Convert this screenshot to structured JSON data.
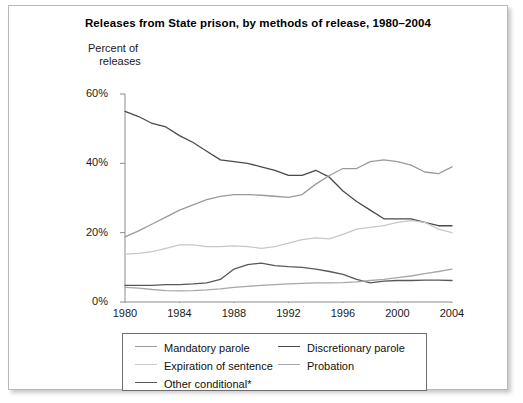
{
  "chart_data": {
    "type": "line",
    "title": "Releases from State prison, by methods of release, 1980–2004",
    "ylabel_line1": "Percent of",
    "ylabel_line2": "releases",
    "xlabel": "",
    "grid": false,
    "legend_position": "bottom",
    "xlim": [
      1980,
      2004
    ],
    "ylim": [
      0,
      60
    ],
    "ytick_labels": [
      "0%",
      "20%",
      "40%",
      "60%"
    ],
    "ytick_values": [
      0,
      20,
      40,
      60
    ],
    "xtick_labels": [
      "1980",
      "1984",
      "1988",
      "1992",
      "1996",
      "2000",
      "2004"
    ],
    "xtick_values": [
      1980,
      1984,
      1988,
      1992,
      1996,
      2000,
      2004
    ],
    "x": [
      1980,
      1981,
      1982,
      1983,
      1984,
      1985,
      1986,
      1987,
      1988,
      1989,
      1990,
      1991,
      1992,
      1993,
      1994,
      1995,
      1996,
      1997,
      1998,
      1999,
      2000,
      2001,
      2002,
      2003,
      2004
    ],
    "footnote": "*",
    "series": [
      {
        "name": "Discretionary parole",
        "color": "#4a4a4a",
        "values": [
          55.0,
          53.5,
          51.5,
          50.5,
          48.0,
          46.0,
          43.5,
          41.0,
          40.5,
          40.0,
          39.0,
          38.0,
          36.5,
          36.5,
          38.0,
          36.0,
          32.0,
          29.0,
          26.5,
          24.0,
          24.0,
          24.0,
          23.0,
          22.0,
          22.0
        ]
      },
      {
        "name": "Mandatory parole",
        "color": "#9a9a9a",
        "values": [
          18.8,
          20.5,
          22.5,
          24.5,
          26.5,
          28.0,
          29.5,
          30.5,
          31.0,
          31.0,
          30.8,
          30.5,
          30.2,
          31.0,
          34.0,
          36.5,
          38.5,
          38.5,
          40.5,
          41.0,
          40.5,
          39.5,
          37.5,
          37.0,
          39.0
        ]
      },
      {
        "name": "Expiration of sentence",
        "color": "#c8c8c8",
        "values": [
          13.8,
          14.0,
          14.5,
          15.5,
          16.5,
          16.5,
          16.0,
          16.0,
          16.2,
          16.0,
          15.5,
          16.0,
          17.0,
          18.0,
          18.5,
          18.2,
          19.5,
          21.0,
          21.5,
          22.0,
          23.0,
          23.5,
          23.0,
          21.0,
          20.0
        ]
      },
      {
        "name": "Other conditional",
        "color": "#585858",
        "values": [
          4.8,
          4.8,
          4.8,
          5.0,
          5.0,
          5.2,
          5.5,
          6.5,
          9.5,
          10.8,
          11.2,
          10.5,
          10.2,
          10.0,
          9.5,
          8.8,
          8.0,
          6.5,
          5.5,
          6.0,
          6.2,
          6.2,
          6.3,
          6.3,
          6.2
        ]
      },
      {
        "name": "Probation",
        "color": "#a8a8a8",
        "values": [
          4.2,
          4.0,
          3.6,
          3.3,
          3.2,
          3.3,
          3.5,
          3.8,
          4.2,
          4.5,
          4.8,
          5.0,
          5.2,
          5.4,
          5.5,
          5.5,
          5.6,
          5.8,
          6.2,
          6.5,
          7.0,
          7.5,
          8.2,
          8.8,
          9.5
        ]
      }
    ],
    "legend_entries": [
      {
        "label": "Mandatory parole",
        "color": "#9a9a9a"
      },
      {
        "label": "Discretionary parole",
        "color": "#4a4a4a"
      },
      {
        "label": "Expiration of sentence",
        "color": "#c8c8c8"
      },
      {
        "label": "Probation",
        "color": "#a8a8a8"
      },
      {
        "label": "Other conditional*",
        "color": "#585858"
      }
    ]
  }
}
